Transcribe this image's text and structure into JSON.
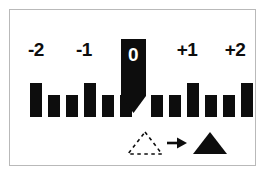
{
  "figure": {
    "title": "",
    "background_color": "#ffffff",
    "border_color": "#b9b9b9",
    "bar_color": "#0d0d0d",
    "marker_color": "#0d0d0d",
    "zero_label_color": "#ffffff"
  },
  "axis_labels": [
    {
      "text": "-2",
      "x": 36,
      "y": 40
    },
    {
      "text": "-1",
      "x": 84,
      "y": 40
    },
    {
      "text": "0",
      "x": 133,
      "y": 45
    },
    {
      "text": "+1",
      "x": 187,
      "y": 40
    },
    {
      "text": "+2",
      "x": 235,
      "y": 40
    }
  ],
  "marker": {
    "name": "zero-position-pin",
    "label": "0",
    "x": 121,
    "y": 39,
    "width": 25,
    "body_height": 57,
    "tip_height": 17
  },
  "legend": {
    "before": {
      "name": "dashed-triangle",
      "style": "dashed-outline"
    },
    "arrow": {
      "name": "arrow-right",
      "glyph": "→"
    },
    "after": {
      "name": "solid-triangle",
      "style": "filled"
    }
  },
  "chart_data": {
    "type": "bar",
    "title": "",
    "xlabel": "",
    "ylabel": "",
    "grid": false,
    "legend_position": "bottom",
    "categories": [
      "-2",
      "",
      "",
      "-1",
      "",
      "",
      "",
      "",
      "+1",
      "",
      "",
      "+2"
    ],
    "tick_labels": [
      "-2",
      "-1",
      "0",
      "+1",
      "+2"
    ],
    "values": [
      34,
      22,
      22,
      34,
      22,
      22,
      22,
      22,
      34,
      22,
      22,
      34
    ],
    "ylim": [
      0,
      40
    ],
    "bar_width": 12,
    "bar_gap": 6,
    "baseline_y": 117,
    "bars": [
      {
        "index": 0,
        "x": 30,
        "height": 34,
        "tall": true
      },
      {
        "index": 1,
        "x": 48,
        "height": 22,
        "tall": false
      },
      {
        "index": 2,
        "x": 66,
        "height": 22,
        "tall": false
      },
      {
        "index": 3,
        "x": 84,
        "height": 34,
        "tall": true
      },
      {
        "index": 4,
        "x": 102,
        "height": 22,
        "tall": false
      },
      {
        "index": 5,
        "x": 120,
        "height": 22,
        "tall": false
      },
      {
        "index": 6,
        "x": 151,
        "height": 22,
        "tall": false
      },
      {
        "index": 7,
        "x": 169,
        "height": 22,
        "tall": false
      },
      {
        "index": 8,
        "x": 187,
        "height": 34,
        "tall": true
      },
      {
        "index": 9,
        "x": 205,
        "height": 22,
        "tall": false
      },
      {
        "index": 10,
        "x": 223,
        "height": 22,
        "tall": false
      },
      {
        "index": 11,
        "x": 241,
        "height": 34,
        "tall": true
      }
    ]
  }
}
